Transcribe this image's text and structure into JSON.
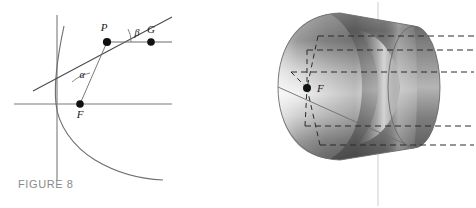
{
  "figure": {
    "caption": "FIGURE 8",
    "panels": [
      {
        "id": "parabola-2d",
        "kind": "2d-parabola-reflection-diagram",
        "labels": {
          "point_p": "P",
          "point_f": "F",
          "point_g": "G",
          "angle_alpha": "α",
          "angle_beta": "β"
        },
        "elements": {
          "x_axis": "horizontal-axis",
          "y_axis": "vertical-axis",
          "curve": "parabola",
          "tangent": "tangent-line-at-P",
          "focal_segment": "segment-F-to-P",
          "ray": "horizontal-ray-P-to-G"
        }
      },
      {
        "id": "paraboloid-3d",
        "kind": "3d-paraboloid-reflector",
        "labels": {
          "point_f": "F"
        },
        "elements": {
          "surface": "paraboloid-surface",
          "rim": "paraboloid-rim-ellipse",
          "incoming_rays": "horizontal-dashed-rays",
          "reflected_rays": "dashed-rays-to-focus",
          "axis": "central-vertical-line"
        },
        "ray_count": 5
      }
    ]
  },
  "colors": {
    "ink": "#1a1a1a",
    "axis": "#6e6e6e",
    "curve": "#6b6b6b",
    "caption": "#8a8a8a",
    "surface_light": "#f2f2f2",
    "surface_mid": "#9a9a9a",
    "surface_dark": "#5d5d5d",
    "dash": "#2b2b2b"
  }
}
